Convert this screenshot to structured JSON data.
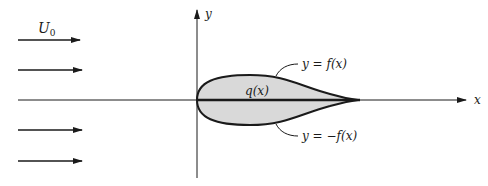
{
  "diagram": {
    "freestream_label": "U",
    "freestream_subscript": "0",
    "y_axis_label": "y",
    "x_axis_label": "x",
    "upper_curve_label": "y = f(x)",
    "lower_curve_label": "y = −f(x)",
    "source_label": "q(x)",
    "colors": {
      "body_fill": "#d9d9d9",
      "stroke": "#1a1a1a"
    }
  }
}
